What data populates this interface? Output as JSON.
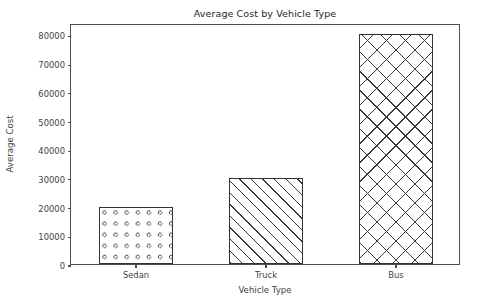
{
  "chart_data": {
    "type": "bar",
    "title": "Average Cost by Vehicle Type",
    "xlabel": "Vehicle Type",
    "ylabel": "Average Cost",
    "categories": [
      "Sedan",
      "Truck",
      "Bus"
    ],
    "values": [
      20000,
      30000,
      80000
    ],
    "ylim": [
      0,
      84000
    ],
    "yticks": [
      0,
      10000,
      20000,
      30000,
      40000,
      50000,
      60000,
      70000,
      80000
    ],
    "ytick_labels": [
      "0",
      "10000",
      "20000",
      "30000",
      "40000",
      "50000",
      "60000",
      "70000",
      "80000"
    ],
    "grid": false,
    "legend": null,
    "bar_styles": [
      {
        "category": "Sedan",
        "hatch": "o",
        "facecolor": "#ffffff",
        "edgecolor": "#333333"
      },
      {
        "category": "Truck",
        "hatch": "/",
        "facecolor": "#ffffff",
        "edgecolor": "#333333"
      },
      {
        "category": "Bus",
        "hatch": "x",
        "facecolor": "#ffffff",
        "edgecolor": "#333333"
      }
    ],
    "colors": {
      "figure_background": "#ffffff",
      "axes_background": "#ffffff",
      "axis_line": "#4d4d4d",
      "text": "#3f3f3f",
      "title_text": "#262626"
    }
  }
}
